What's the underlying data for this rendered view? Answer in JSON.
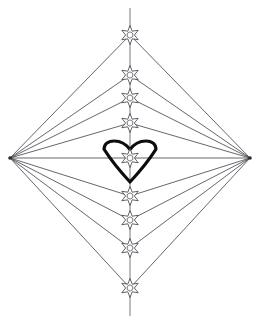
{
  "artwork": {
    "title": "Star and Heart Diamond Diagram",
    "description": "Symmetrical line-art diamond formed by rays from left and right vertices converging on nine six-pointed stars along a vertical axis, with a bold heart outline at the center",
    "background_color": "#ffffff",
    "line_color": "#4a4a52",
    "axis_color": "#6b6b73",
    "star_stroke_color": "#3a3a42",
    "star_fill_color": "#ffffff",
    "heart_color": "#0d0d0f",
    "canvas": {
      "width": 260,
      "height": 322
    }
  },
  "geometry": {
    "left_vertex": {
      "x": 10,
      "y": 158,
      "label": "left-apex"
    },
    "right_vertex": {
      "x": 250,
      "y": 158,
      "label": "right-apex"
    },
    "axis_x": 130,
    "axis_top_y": 8,
    "axis_bottom_y": 316,
    "star_radius_outer": 9.5,
    "star_radius_inner": 4.4,
    "hex_radius": 3.2,
    "star_count": 9,
    "stars": [
      {
        "index": 1,
        "x": 130,
        "y": 35,
        "label": "star-top-1"
      },
      {
        "index": 2,
        "x": 130,
        "y": 75,
        "label": "star-upper-2"
      },
      {
        "index": 3,
        "x": 130,
        "y": 98,
        "label": "star-upper-3"
      },
      {
        "index": 4,
        "x": 130,
        "y": 123,
        "label": "star-upper-4"
      },
      {
        "index": 5,
        "x": 130,
        "y": 158,
        "label": "star-center-5"
      },
      {
        "index": 6,
        "x": 130,
        "y": 196,
        "label": "star-lower-6"
      },
      {
        "index": 7,
        "x": 130,
        "y": 220,
        "label": "star-lower-7"
      },
      {
        "index": 8,
        "x": 130,
        "y": 248,
        "label": "star-lower-8"
      },
      {
        "index": 9,
        "x": 130,
        "y": 288,
        "label": "star-bottom-9"
      }
    ],
    "heart": {
      "center_x": 130,
      "top_y": 141,
      "bottom_y": 182,
      "half_width": 26,
      "label": "center-heart"
    }
  },
  "labels": {
    "figure_name": "star-heart-diamond",
    "left_apex_name": "left-convergence-point",
    "right_apex_name": "right-convergence-point",
    "axis_name": "vertical-center-axis",
    "heart_name": "heart-outline",
    "ray_group_left": "left-ray-fan",
    "ray_group_right": "right-ray-fan"
  }
}
